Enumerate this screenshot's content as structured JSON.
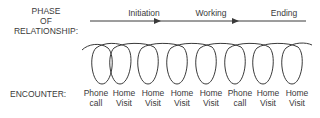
{
  "phase": {
    "label_lines": [
      "PHASE",
      "OF",
      "RELATIONSHIP:"
    ],
    "stages": [
      {
        "name": "Initiation",
        "x": 144
      },
      {
        "name": "Working",
        "x": 211
      },
      {
        "name": "Ending",
        "x": 284
      }
    ]
  },
  "encounter": {
    "label": "ENCOUNTER:",
    "items": [
      {
        "line1": "Phone",
        "line2": "call",
        "x": 96
      },
      {
        "line1": "Home",
        "line2": "Visit",
        "x": 124
      },
      {
        "line1": "Home",
        "line2": "Visit",
        "x": 153
      },
      {
        "line1": "Home",
        "line2": "Visit",
        "x": 182
      },
      {
        "line1": "Home",
        "line2": "Visit",
        "x": 211
      },
      {
        "line1": "Phone",
        "line2": "call",
        "x": 240
      },
      {
        "line1": "Home",
        "line2": "Visit",
        "x": 268
      },
      {
        "line1": "Home",
        "line2": "Visit",
        "x": 297
      }
    ]
  },
  "colors": {
    "stroke": "#3a3a3a",
    "text": "#3a3a3a"
  }
}
